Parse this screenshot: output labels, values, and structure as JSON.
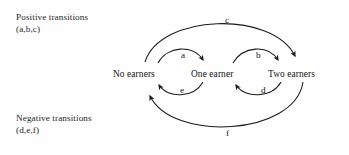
{
  "diagram": {
    "background_color": "#fefefe",
    "stroke_color": "#1a1a1a",
    "legend": {
      "positive": {
        "line1": "Positive transitions",
        "line2": "(a,b,c)"
      },
      "negative": {
        "line1": "Negative transitions",
        "line2": "(d,e,f)"
      }
    },
    "nodes": [
      {
        "id": "no-earners",
        "label": "No earners"
      },
      {
        "id": "one-earner",
        "label": "One earner"
      },
      {
        "id": "two-earners",
        "label": "Two earners"
      }
    ],
    "edges": [
      {
        "id": "a",
        "label": "a",
        "from": "No earners",
        "to": "One earner",
        "direction": "right",
        "type": "positive"
      },
      {
        "id": "b",
        "label": "b",
        "from": "One earner",
        "to": "Two earners",
        "direction": "right",
        "type": "positive"
      },
      {
        "id": "c",
        "label": "c",
        "from": "No earners",
        "to": "Two earners",
        "direction": "right",
        "type": "positive"
      },
      {
        "id": "d",
        "label": "d",
        "from": "Two earners",
        "to": "One earner",
        "direction": "left",
        "type": "negative"
      },
      {
        "id": "e",
        "label": "e",
        "from": "One earner",
        "to": "No earners",
        "direction": "left",
        "type": "negative"
      },
      {
        "id": "f",
        "label": "f",
        "from": "Two earners",
        "to": "No earners",
        "direction": "left",
        "type": "negative"
      }
    ]
  }
}
